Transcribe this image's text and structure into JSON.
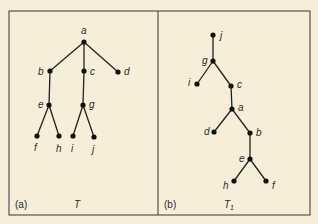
{
  "colors": {
    "background": "#f6eed8",
    "ink": "#222222"
  },
  "panels": [
    {
      "id": "a",
      "caption_label": "(a)",
      "tree_name": "T",
      "tree_subscript": "",
      "nodes": [
        {
          "id": "a",
          "label": "a"
        },
        {
          "id": "b",
          "label": "b"
        },
        {
          "id": "c",
          "label": "c"
        },
        {
          "id": "d",
          "label": "d"
        },
        {
          "id": "e",
          "label": "e"
        },
        {
          "id": "g",
          "label": "g"
        },
        {
          "id": "f",
          "label": "f"
        },
        {
          "id": "h",
          "label": "h"
        },
        {
          "id": "i",
          "label": "i"
        },
        {
          "id": "j",
          "label": "j"
        }
      ],
      "edges": [
        [
          "a",
          "b"
        ],
        [
          "a",
          "c"
        ],
        [
          "a",
          "d"
        ],
        [
          "b",
          "e"
        ],
        [
          "c",
          "g"
        ],
        [
          "e",
          "f"
        ],
        [
          "e",
          "h"
        ],
        [
          "g",
          "i"
        ],
        [
          "g",
          "j"
        ]
      ]
    },
    {
      "id": "b",
      "caption_label": "(b)",
      "tree_name": "T",
      "tree_subscript": "1",
      "nodes": [
        {
          "id": "j",
          "label": "j"
        },
        {
          "id": "g",
          "label": "g"
        },
        {
          "id": "i",
          "label": "i"
        },
        {
          "id": "c",
          "label": "c"
        },
        {
          "id": "a",
          "label": "a"
        },
        {
          "id": "d",
          "label": "d"
        },
        {
          "id": "b",
          "label": "b"
        },
        {
          "id": "e",
          "label": "e"
        },
        {
          "id": "h",
          "label": "h"
        },
        {
          "id": "f",
          "label": "f"
        }
      ],
      "edges": [
        [
          "j",
          "g"
        ],
        [
          "g",
          "i"
        ],
        [
          "g",
          "c"
        ],
        [
          "c",
          "a"
        ],
        [
          "a",
          "d"
        ],
        [
          "a",
          "b"
        ],
        [
          "b",
          "e"
        ],
        [
          "e",
          "h"
        ],
        [
          "e",
          "f"
        ]
      ]
    }
  ]
}
